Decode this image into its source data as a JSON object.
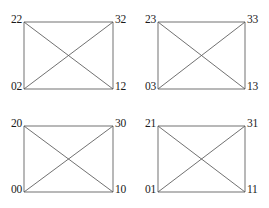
{
  "figure": {
    "background_color": "#ffffff",
    "edge_color": "#575757",
    "label_color": "#1a1a1a",
    "graph_type": "complete-graph-k4",
    "rows": 2,
    "columns": 2
  },
  "graphs": [
    {
      "id": "graph-top-left",
      "nodes": {
        "top_left": "22",
        "top_right": "32",
        "bottom_left": "02",
        "bottom_right": "12"
      }
    },
    {
      "id": "graph-top-right",
      "nodes": {
        "top_left": "23",
        "top_right": "33",
        "bottom_left": "03",
        "bottom_right": "13"
      }
    },
    {
      "id": "graph-bottom-left",
      "nodes": {
        "top_left": "20",
        "top_right": "30",
        "bottom_left": "00",
        "bottom_right": "10"
      }
    },
    {
      "id": "graph-bottom-right",
      "nodes": {
        "top_left": "21",
        "top_right": "31",
        "bottom_left": "01",
        "bottom_right": "11"
      }
    }
  ]
}
